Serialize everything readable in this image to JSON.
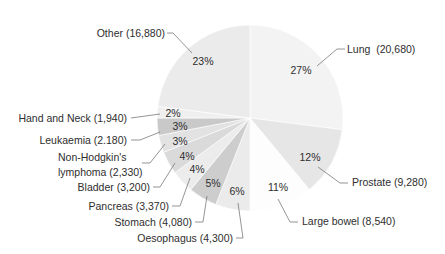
{
  "chart_data": {
    "type": "pie",
    "title": "",
    "start_angle_deg": 0,
    "direction": "clockwise",
    "slices": [
      {
        "name": "Lung",
        "value": 20680,
        "percent": 27,
        "label": "Lung  (20,680)",
        "pct_label": "27%",
        "color": "#f3f3f3"
      },
      {
        "name": "Prostate",
        "value": 9280,
        "percent": 12,
        "label": "Prostate (9,280)",
        "pct_label": "12%",
        "color": "#e6e6e6"
      },
      {
        "name": "Large bowel",
        "value": 8540,
        "percent": 11,
        "label": "Large bowel (8,540)",
        "pct_label": "11%",
        "color": "#fdfdfd"
      },
      {
        "name": "Oesophagus",
        "value": 4300,
        "percent": 6,
        "label": "Oesophagus (4,300)",
        "pct_label": "6%",
        "color": "#ebebeb"
      },
      {
        "name": "Stomach",
        "value": 4080,
        "percent": 5,
        "label": "Stomach (4,080)",
        "pct_label": "5%",
        "color": "#cdcdcd"
      },
      {
        "name": "Pancreas",
        "value": 3370,
        "percent": 4,
        "label": "Pancreas (3,370)",
        "pct_label": "4%",
        "color": "#ececec"
      },
      {
        "name": "Bladder",
        "value": 3200,
        "percent": 4,
        "label": "Bladder (3,200)",
        "pct_label": "4%",
        "color": "#dadada"
      },
      {
        "name": "Non-Hodgkin's lymphoma",
        "value": 2330,
        "percent": 3,
        "label_line1": "Non-Hodgkin's",
        "label_line2": "lymphoma (2,330)",
        "pct_label": "3%",
        "color": "#e2e2e2"
      },
      {
        "name": "Leukaemia",
        "value": 2180,
        "percent": 3,
        "label": "Leukaemia (2.180)",
        "pct_label": "3%",
        "color": "#c9c9c9"
      },
      {
        "name": "Hand and Neck",
        "value": 1940,
        "percent": 2,
        "label": "Hand and Neck (1,940)",
        "pct_label": "2%",
        "color": "#efefef"
      },
      {
        "name": "Other",
        "value": 16880,
        "percent": 23,
        "label": "Other (16,880)",
        "pct_label": "23%",
        "color": "#ebebeb"
      }
    ],
    "legend": "none (callout labels)"
  }
}
